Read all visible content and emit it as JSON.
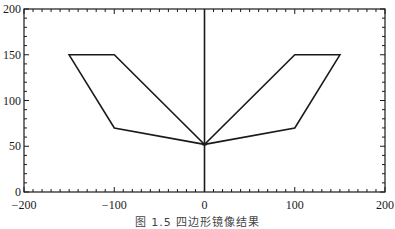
{
  "caption": "图 1.5  四边形镜像结果",
  "chart_data": {
    "type": "line",
    "title": "",
    "xlabel": "",
    "ylabel": "",
    "xlim": [
      -200,
      200
    ],
    "ylim": [
      0,
      200
    ],
    "x_ticks": [
      -200,
      -100,
      0,
      100,
      200
    ],
    "x_tick_labels": [
      "−200",
      "−100",
      "0",
      "100",
      "200"
    ],
    "y_ticks": [
      0,
      50,
      100,
      150,
      200
    ],
    "y_tick_labels": [
      "0",
      "50",
      "100",
      "150",
      "200"
    ],
    "minor_tick_step": 10,
    "grid": false,
    "legend": null,
    "mirror_axis": {
      "x": 0,
      "y_from": 0,
      "y_to": 200
    },
    "series": [
      {
        "name": "original quadrilateral",
        "closed": true,
        "points": [
          [
            -150,
            150
          ],
          [
            -100,
            150
          ],
          [
            0,
            52
          ],
          [
            -100,
            70
          ]
        ]
      },
      {
        "name": "mirrored quadrilateral",
        "closed": true,
        "points": [
          [
            150,
            150
          ],
          [
            100,
            150
          ],
          [
            0,
            52
          ],
          [
            100,
            70
          ]
        ]
      }
    ],
    "line_color": "#1a1a1a"
  }
}
